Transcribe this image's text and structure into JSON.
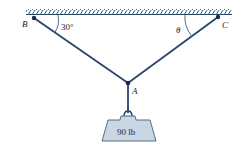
{
  "diagram": {
    "type": "statics-free-body",
    "points": {
      "B": {
        "label": "B"
      },
      "C": {
        "label": "C"
      },
      "A": {
        "label": "A"
      }
    },
    "angles": {
      "at_B": "30°",
      "at_C": "θ"
    },
    "weight": {
      "label": "90 lb"
    },
    "colors": {
      "cable": "#27466b",
      "ceiling": "#27466b",
      "weight_fill": "#c9d6e4",
      "weight_stroke": "#4a5f7a"
    }
  }
}
